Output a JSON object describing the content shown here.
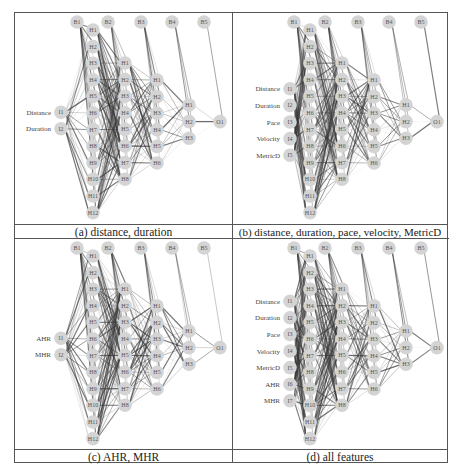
{
  "figure": {
    "panels": [
      {
        "id": "a",
        "caption": "(a) distance, duration",
        "inputs": [
          "Distance",
          "Duration"
        ],
        "input_nodes": [
          "I1",
          "I2"
        ]
      },
      {
        "id": "b",
        "caption": "(b) distance, duration, pace, velocity,  MetricD",
        "inputs": [
          "Distance",
          "Duration",
          "Pace",
          "Velocity",
          "MetricD"
        ],
        "input_nodes": [
          "I1",
          "I2",
          "I3",
          "I4",
          "I5"
        ]
      },
      {
        "id": "c",
        "caption": "(c) AHR, MHR",
        "inputs": [
          "AHR",
          "MHR"
        ],
        "input_nodes": [
          "I1",
          "I2"
        ]
      },
      {
        "id": "d",
        "caption": "(d) all features",
        "inputs": [
          "Distance",
          "Duration",
          "Pace",
          "Velocity",
          "MetricD",
          "AHR",
          "MHR"
        ],
        "input_nodes": [
          "I1",
          "I2",
          "I3",
          "I4",
          "I5",
          "I6",
          "I7"
        ]
      }
    ],
    "bias_nodes": [
      "B1",
      "B2",
      "B3",
      "B4",
      "B5"
    ],
    "hidden_layers": [
      [
        "H1",
        "H2",
        "H3",
        "H4",
        "H5",
        "H6",
        "H7",
        "H8",
        "H9",
        "H10",
        "H11",
        "H12"
      ],
      [
        "H1",
        "H2",
        "H3",
        "H4",
        "H5",
        "H6",
        "H7",
        "H8"
      ],
      [
        "H1",
        "H2",
        "H3",
        "H4",
        "H5",
        "H6"
      ],
      [
        "H1",
        "H2",
        "H3"
      ]
    ],
    "output_nodes": [
      "O1"
    ],
    "colors": {
      "node_fill": "#d4d4d4",
      "edge": "#333333",
      "border": "#555555"
    }
  }
}
